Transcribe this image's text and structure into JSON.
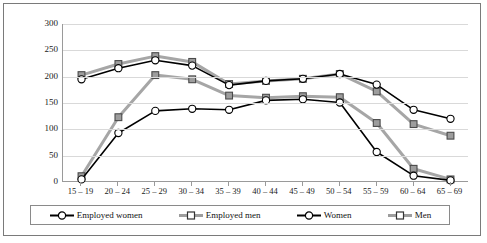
{
  "chart_data": {
    "type": "line",
    "title": "",
    "xlabel": "",
    "ylabel": "",
    "categories": [
      "15 – 19",
      "20 – 24",
      "25 – 29",
      "30 – 34",
      "35 – 39",
      "40 – 44",
      "45 – 49",
      "50 – 54",
      "55 – 59",
      "60 – 64",
      "65 – 69"
    ],
    "ylim": [
      0,
      300
    ],
    "yticks": [
      0,
      50,
      100,
      150,
      200,
      250,
      300
    ],
    "grid": true,
    "legend_position": "bottom",
    "series": [
      {
        "name": "Employed women",
        "color": "#000000",
        "marker": "circle",
        "values": [
          5,
          93,
          135,
          139,
          137,
          155,
          157,
          151,
          57,
          12,
          3
        ]
      },
      {
        "name": "Employed men",
        "color": "#a6a6a6",
        "marker": "square",
        "values": [
          11,
          123,
          203,
          195,
          164,
          160,
          163,
          161,
          112,
          25,
          5
        ]
      },
      {
        "name": "Women",
        "color": "#000000",
        "marker": "circle",
        "values": [
          195,
          216,
          231,
          221,
          184,
          192,
          196,
          205,
          185,
          137,
          120
        ]
      },
      {
        "name": "Men",
        "color": "#a6a6a6",
        "marker": "square",
        "values": [
          203,
          224,
          239,
          228,
          186,
          192,
          196,
          205,
          172,
          110,
          88
        ]
      }
    ]
  },
  "legend": {
    "items": [
      {
        "label": "Employed women",
        "icon": "line-circle-marker-black"
      },
      {
        "label": "Employed men",
        "icon": "line-square-marker-gray"
      },
      {
        "label": "Women",
        "icon": "line-circle-marker-black"
      },
      {
        "label": "Men",
        "icon": "line-square-marker-gray"
      }
    ]
  }
}
